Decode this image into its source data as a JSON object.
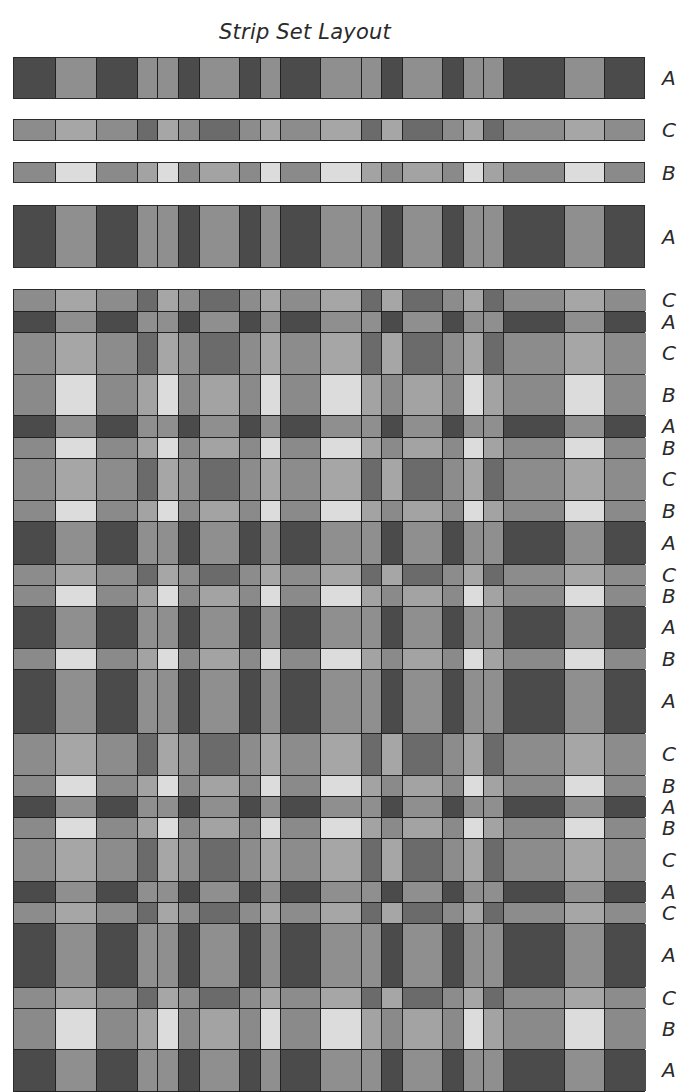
{
  "title": "Strip Set Layout",
  "columns": {
    "widths": [
      42,
      41,
      41,
      20,
      21,
      21,
      40,
      21,
      20,
      40,
      41,
      20,
      21,
      40,
      21,
      20,
      20,
      61,
      40,
      41
    ]
  },
  "palette": {
    "A_dark": "#4b4b4b",
    "A_med": "#8f8f8f",
    "C_dark": "#6b6b6b",
    "C_med": "#8c8c8c",
    "C_light": "#a6a6a6",
    "B_white": "#dcdcdc",
    "B_light": "#a3a3a3",
    "B_med": "#8a8a8a"
  },
  "strips": {
    "A": [
      "A_dark",
      "A_med",
      "A_dark",
      "A_med",
      "A_med",
      "A_dark",
      "A_med",
      "A_dark",
      "A_med",
      "A_dark",
      "A_med",
      "A_med",
      "A_dark",
      "A_med",
      "A_dark",
      "A_med",
      "A_med",
      "A_dark",
      "A_med",
      "A_dark"
    ],
    "C": [
      "C_med",
      "C_light",
      "C_med",
      "C_dark",
      "C_light",
      "C_med",
      "C_dark",
      "C_med",
      "C_light",
      "C_med",
      "C_light",
      "C_dark",
      "C_light",
      "C_dark",
      "C_med",
      "C_light",
      "C_dark",
      "C_med",
      "C_light",
      "C_med"
    ],
    "B": [
      "B_med",
      "B_white",
      "B_med",
      "B_light",
      "B_white",
      "B_med",
      "B_light",
      "B_med",
      "B_white",
      "B_med",
      "B_white",
      "B_light",
      "B_med",
      "B_light",
      "B_med",
      "B_white",
      "B_light",
      "B_med",
      "B_white",
      "B_med"
    ]
  },
  "separate_strips": [
    {
      "type": "A",
      "label": "A",
      "top": 57,
      "height": 42
    },
    {
      "type": "C",
      "label": "C",
      "top": 119,
      "height": 22
    },
    {
      "type": "B",
      "label": "B",
      "top": 162,
      "height": 21
    },
    {
      "type": "A",
      "label": "A",
      "top": 205,
      "height": 63
    }
  ],
  "woven_rows": [
    {
      "type": "C",
      "label": "C",
      "height": 22
    },
    {
      "type": "A",
      "label": "A",
      "height": 21
    },
    {
      "type": "C",
      "label": "C",
      "height": 42
    },
    {
      "type": "B",
      "label": "B",
      "height": 41
    },
    {
      "type": "A",
      "label": "A",
      "height": 22
    },
    {
      "type": "B",
      "label": "B",
      "height": 21
    },
    {
      "type": "C",
      "label": "C",
      "height": 42
    },
    {
      "type": "B",
      "label": "B",
      "height": 21
    },
    {
      "type": "A",
      "label": "A",
      "height": 43
    },
    {
      "type": "C",
      "label": "C",
      "height": 21
    },
    {
      "type": "B",
      "label": "B",
      "height": 21
    },
    {
      "type": "A",
      "label": "A",
      "height": 42
    },
    {
      "type": "B",
      "label": "B",
      "height": 21
    },
    {
      "type": "A",
      "label": "A",
      "height": 64
    },
    {
      "type": "C",
      "label": "C",
      "height": 42
    },
    {
      "type": "B",
      "label": "B",
      "height": 21
    },
    {
      "type": "A",
      "label": "A",
      "height": 21
    },
    {
      "type": "B",
      "label": "B",
      "height": 21
    },
    {
      "type": "C",
      "label": "C",
      "height": 43
    },
    {
      "type": "A",
      "label": "A",
      "height": 21
    },
    {
      "type": "C",
      "label": "C",
      "height": 21
    },
    {
      "type": "A",
      "label": "A",
      "height": 64
    },
    {
      "type": "C",
      "label": "C",
      "height": 21
    },
    {
      "type": "B",
      "label": "B",
      "height": 41
    },
    {
      "type": "A",
      "label": "A",
      "height": 42
    }
  ]
}
